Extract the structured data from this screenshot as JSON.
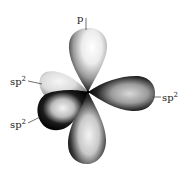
{
  "figure": {
    "labels": {
      "p_top": "p",
      "sp2_upper_left_base": "sp",
      "sp2_upper_left_sup": "2",
      "sp2_lower_left_base": "sp",
      "sp2_lower_left_sup": "2",
      "sp2_right_base": "sp",
      "sp2_right_sup": "2"
    },
    "orbitals": [
      {
        "name": "p-orbital-top-lobe",
        "type": "p"
      },
      {
        "name": "p-orbital-bottom-lobe",
        "type": "p"
      },
      {
        "name": "sp2-orbital-right",
        "type": "sp2"
      },
      {
        "name": "sp2-orbital-upper-left",
        "type": "sp2"
      },
      {
        "name": "sp2-orbital-lower-left",
        "type": "sp2"
      }
    ],
    "colors": {
      "dark": "#0d0d0d",
      "mid": "#7a7a7a",
      "light": "#f2f2f2",
      "background": "#ffffff"
    }
  }
}
